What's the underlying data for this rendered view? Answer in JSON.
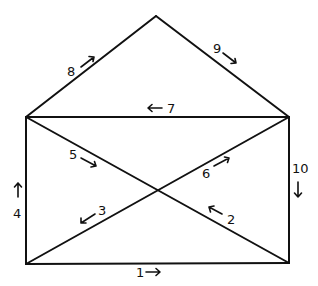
{
  "diagram": {
    "colors": {
      "line": "#111111",
      "background": "#ffffff"
    },
    "vertices": {
      "apex": [
        156,
        16
      ],
      "top_left": [
        26,
        117
      ],
      "top_right": [
        289,
        117
      ],
      "bottom_left": [
        26,
        264
      ],
      "bottom_right": [
        289,
        263
      ],
      "center": [
        157,
        190
      ]
    },
    "edges": [
      {
        "step": "1",
        "from": "bottom_left",
        "to": "bottom_right",
        "arrow": "right"
      },
      {
        "step": "2",
        "from": "bottom_right",
        "to": "center",
        "arrow": "up-left"
      },
      {
        "step": "3",
        "from": "center",
        "to": "bottom_left",
        "arrow": "down-left"
      },
      {
        "step": "4",
        "from": "bottom_left",
        "to": "top_left",
        "arrow": "up"
      },
      {
        "step": "5",
        "from": "top_left",
        "to": "center",
        "arrow": "down-right"
      },
      {
        "step": "6",
        "from": "center",
        "to": "top_right",
        "arrow": "up-right"
      },
      {
        "step": "7",
        "from": "top_right",
        "to": "top_left",
        "arrow": "left"
      },
      {
        "step": "8",
        "from": "top_left",
        "to": "apex",
        "arrow": "up-right"
      },
      {
        "step": "9",
        "from": "apex",
        "to": "top_right",
        "arrow": "down-right"
      },
      {
        "step": "10",
        "from": "top_right",
        "to": "bottom_right",
        "arrow": "down"
      }
    ],
    "labels": {
      "l1": "1",
      "l2": "2",
      "l3": "3",
      "l4": "4",
      "l5": "5",
      "l6": "6",
      "l7": "7",
      "l8": "8",
      "l9": "9",
      "l10": "10"
    }
  }
}
